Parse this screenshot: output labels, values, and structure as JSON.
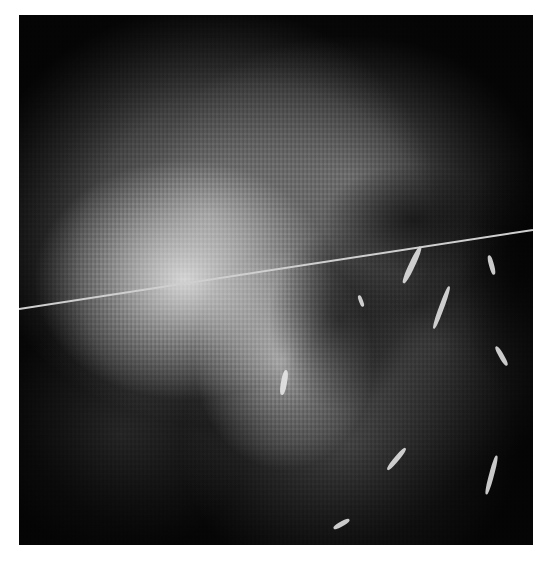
{
  "image": {
    "description": "Grayscale in-vivo microscopy image of tissue with a bright central region and a dark pocket on the right containing bright tortuous vessel-like structures",
    "colors": {
      "background": "#ffffff",
      "image_base": "#0a0a0a",
      "scan_line": "#cfcfcf"
    },
    "frame": {
      "x": 19,
      "y": 15,
      "width": 514,
      "height": 530
    },
    "scan_line": {
      "x1": 0,
      "y1": 293,
      "x2": 514,
      "y2": 214
    }
  }
}
